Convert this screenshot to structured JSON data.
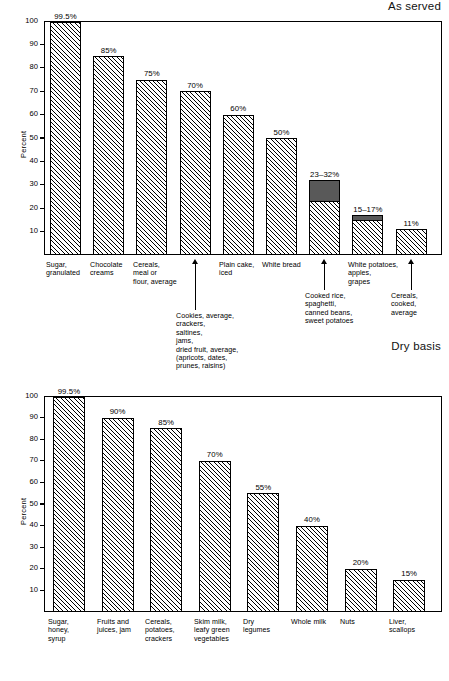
{
  "figure": {
    "panels": [
      {
        "id": "as-served",
        "title": "As served",
        "ylabel": "Percent",
        "yticks": [
          "100",
          "90",
          "80",
          "70",
          "60",
          "50",
          "40",
          "30",
          "20",
          "10"
        ],
        "bars": [
          {
            "category": "Sugar,\ngranulated",
            "label": "99.5%",
            "value": 99.5
          },
          {
            "category": "Chocolate\ncreams",
            "label": "85%",
            "value": 85
          },
          {
            "category": "Cereals,\nmeal or\nflour, average",
            "label": "75%",
            "value": 75
          },
          {
            "category": "Cookies, average,\ncrackers,\nsaltines,\njams,\ndried fruit, average,\n(apricots, dates,\nprunes, raisins)",
            "label": "70%",
            "value": 70
          },
          {
            "category": "Plain cake,\niced",
            "label": "60%",
            "value": 60
          },
          {
            "category": "White bread",
            "label": "50%",
            "value": 50
          },
          {
            "category": "Cooked rice,\nspaghetti,\ncanned beans,\nsweet potatoes",
            "label": "23–32%",
            "value": 32,
            "low": 23
          },
          {
            "category": "White potatoes,\napples,\ngrapes",
            "label": "15–17%",
            "value": 17,
            "low": 15
          },
          {
            "category": "Cereals,\ncooked,\naverage",
            "label": "11%",
            "value": 11
          }
        ]
      },
      {
        "id": "dry-basis",
        "title": "Dry basis",
        "ylabel": "Percent",
        "yticks": [
          "100",
          "90",
          "80",
          "70",
          "60",
          "50",
          "40",
          "30",
          "20",
          "10"
        ],
        "bars": [
          {
            "category": "Sugar,\nhoney,\nsyrup",
            "label": "99.5%",
            "value": 99.5
          },
          {
            "category": "Fruits and\njuices, jam",
            "label": "90%",
            "value": 90
          },
          {
            "category": "Cereals,\npotatoes,\ncrackers",
            "label": "85%",
            "value": 85
          },
          {
            "category": "Skim milk,\nleafy green\nvegetables",
            "label": "70%",
            "value": 70
          },
          {
            "category": "Dry\nlegumes",
            "label": "55%",
            "value": 55
          },
          {
            "category": "Whole milk",
            "label": "40%",
            "value": 40
          },
          {
            "category": "Nuts",
            "label": "20%",
            "value": 20
          },
          {
            "category": "Liver,\nscallops",
            "label": "15%",
            "value": 15
          }
        ]
      }
    ]
  },
  "chart_data": [
    {
      "type": "bar",
      "title": "As served",
      "xlabel": "",
      "ylabel": "Percent",
      "ylim": [
        0,
        100
      ],
      "grid": false,
      "legend": "none",
      "yticks": [
        10,
        20,
        30,
        40,
        50,
        60,
        70,
        80,
        90,
        100
      ],
      "categories": [
        "Sugar, granulated",
        "Chocolate creams",
        "Cereals, meal or flour, average",
        "Cookies, average, crackers, saltines, jams, dried fruit, average, (apricots, dates, prunes, raisins)",
        "Plain cake, iced",
        "White bread",
        "Cooked rice, spaghetti, canned beans, sweet potatoes",
        "White potatoes, apples, grapes",
        "Cereals, cooked, average"
      ],
      "values": [
        99.5,
        85,
        75,
        70,
        60,
        50,
        32,
        17,
        11
      ],
      "range_low": [
        null,
        null,
        null,
        null,
        null,
        null,
        23,
        15,
        null
      ],
      "data_labels": [
        "99.5%",
        "85%",
        "75%",
        "70%",
        "60%",
        "50%",
        "23–32%",
        "15–17%",
        "11%"
      ]
    },
    {
      "type": "bar",
      "title": "Dry basis",
      "xlabel": "",
      "ylabel": "Percent",
      "ylim": [
        0,
        100
      ],
      "grid": false,
      "legend": "none",
      "yticks": [
        10,
        20,
        30,
        40,
        50,
        60,
        70,
        80,
        90,
        100
      ],
      "categories": [
        "Sugar, honey, syrup",
        "Fruits and juices, jam",
        "Cereals, potatoes, crackers",
        "Skim milk, leafy green vegetables",
        "Dry legumes",
        "Whole milk",
        "Nuts",
        "Liver, scallops"
      ],
      "values": [
        99.5,
        90,
        85,
        70,
        55,
        40,
        20,
        15
      ],
      "data_labels": [
        "99.5%",
        "90%",
        "85%",
        "70%",
        "55%",
        "40%",
        "20%",
        "15%"
      ]
    }
  ]
}
